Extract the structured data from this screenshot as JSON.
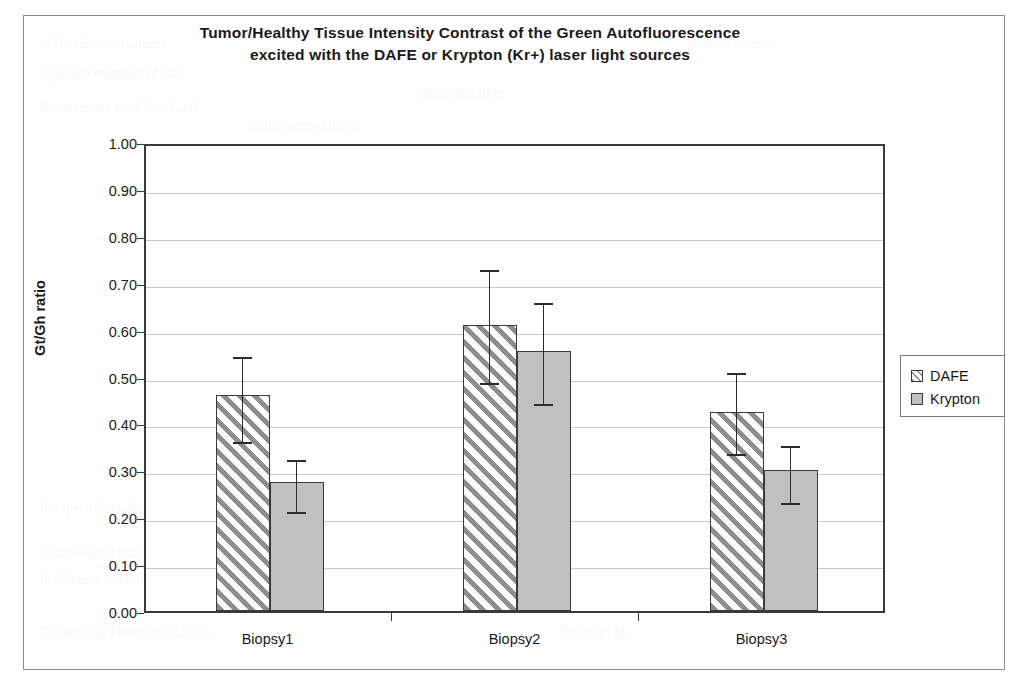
{
  "chart_data": {
    "type": "bar",
    "title": "Tumor/Healthy Tissue Intensity Contrast of the Green Autofluorescence excited with the DAFE or Krypton (Kr+) laser light sources",
    "title_line1": "Tumor/Healthy Tissue Intensity Contrast of the Green Autofluorescence",
    "title_line2": "excited with the DAFE or Krypton (Kr+) laser light sources",
    "xlabel": "",
    "ylabel": "Gt/Gh ratio",
    "ylim": [
      0.0,
      1.0
    ],
    "ytick_step": 0.1,
    "grid": true,
    "legend_position": "right",
    "categories": [
      "Biopsy1",
      "Biopsy2",
      "Biopsy3"
    ],
    "ytick_labels": [
      "1.00",
      "0.90",
      "0.80",
      "0.70",
      "0.60",
      "0.50",
      "0.40",
      "0.30",
      "0.20",
      "0.10",
      "0.00"
    ],
    "ytick_values": [
      1.0,
      0.9,
      0.8,
      0.7,
      0.6,
      0.5,
      0.4,
      0.3,
      0.2,
      0.1,
      0.0
    ],
    "series": [
      {
        "name": "DAFE",
        "fill": "diagonal-hatch",
        "color": "#8e8e8e",
        "values": [
          0.46,
          0.61,
          0.425
        ],
        "error_upper": [
          0.55,
          0.735,
          0.515
        ],
        "error_lower": [
          0.365,
          0.49,
          0.34
        ]
      },
      {
        "name": "Krypton",
        "fill": "solid",
        "color": "#c0c0c0",
        "values": [
          0.275,
          0.555,
          0.3
        ],
        "error_upper": [
          0.33,
          0.665,
          0.36
        ],
        "error_lower": [
          0.215,
          0.445,
          0.235
        ]
      }
    ]
  },
  "legend": {
    "items": [
      {
        "label": "DAFE",
        "swatch": "diagonal-hatch"
      },
      {
        "label": "Krypton",
        "swatch": "solid-gray"
      }
    ]
  },
  "background_ghost_text": [
    "of the tissue structures",
    "normal mucosa",
    "by a concentration of the",
    "excitation light",
    "fluorescence modulated and",
    "in the normal tissue"
  ]
}
